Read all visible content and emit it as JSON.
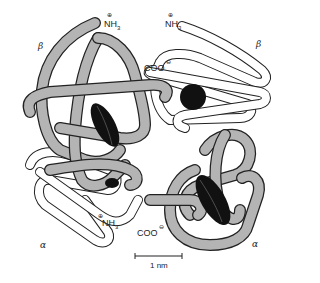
{
  "figure": {
    "chain_labels": {
      "beta_top_left": "β",
      "beta_top_right": "β",
      "alpha_bottom_left": "α",
      "alpha_bottom_right": "α"
    },
    "terminus_labels": {
      "nh3_top_left": "NH",
      "nh3_top_left_sub": "3",
      "nh3_top_right": "NH",
      "nh3_top_right_sub": "3",
      "nh3_bottom_left": "NH",
      "nh3_bottom_left_sub": "3",
      "coo_top": "COO",
      "coo_bottom": "COO",
      "positive_charge": "⊕",
      "negative_charge": "⊖"
    },
    "scale_bar": {
      "label": "1 nm"
    },
    "colors": {
      "gray_chain": "#b4b4b4",
      "white_chain": "#ffffff",
      "heme": "#111111",
      "outline": "#222222"
    }
  }
}
